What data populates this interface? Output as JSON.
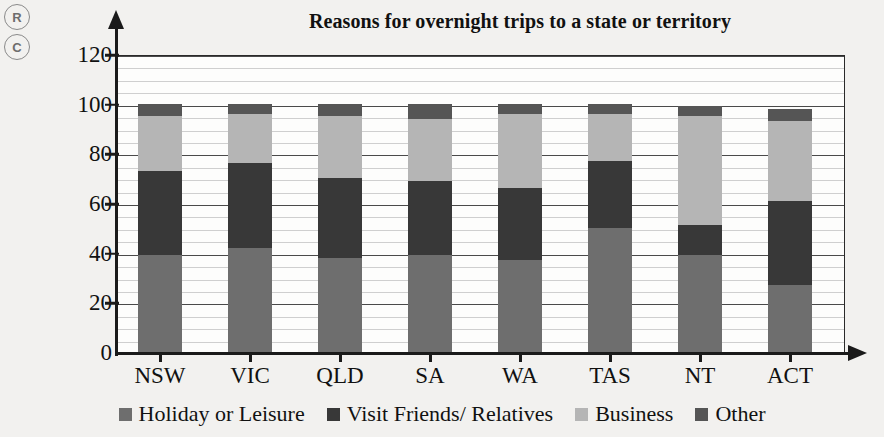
{
  "margin_marks": [
    {
      "name": "mark-r",
      "label": "R"
    },
    {
      "name": "mark-c",
      "label": "C"
    }
  ],
  "chart_data": {
    "type": "bar",
    "subtype": "stacked-bar",
    "title": "Reasons for overnight trips to a state or territory",
    "xlabel": "",
    "ylabel": "",
    "ylim": [
      0,
      120
    ],
    "y_major_ticks": [
      0,
      20,
      40,
      60,
      80,
      100,
      120
    ],
    "y_minor_step": 5,
    "grid": true,
    "legend_position": "bottom",
    "categories": [
      "NSW",
      "VIC",
      "QLD",
      "SA",
      "WA",
      "TAS",
      "NT",
      "ACT"
    ],
    "series": [
      {
        "name": "Holiday or Leisure",
        "color": "#6e6e6e",
        "values": [
          39,
          42,
          38,
          39,
          37,
          50,
          39,
          27
        ]
      },
      {
        "name": "Visit Friends/ Relatives",
        "color": "#383838",
        "values": [
          34,
          34,
          32,
          30,
          29,
          27,
          12,
          34
        ]
      },
      {
        "name": "Business",
        "color": "#b5b5b5",
        "values": [
          22,
          20,
          25,
          25,
          30,
          19,
          44,
          32
        ]
      },
      {
        "name": "Other",
        "color": "#555555",
        "values": [
          5,
          4,
          5,
          6,
          4,
          4,
          4,
          5
        ]
      }
    ],
    "cumulative_tops": {
      "NSW": [
        39,
        73,
        95,
        100
      ],
      "VIC": [
        42,
        76,
        96,
        100
      ],
      "QLD": [
        38,
        70,
        95,
        100
      ],
      "SA": [
        39,
        69,
        94,
        100
      ],
      "WA": [
        37,
        66,
        96,
        100
      ],
      "TAS": [
        50,
        77,
        96,
        100
      ],
      "NT": [
        39,
        51,
        95,
        99
      ],
      "ACT": [
        27,
        61,
        93,
        98
      ]
    }
  },
  "axis": {
    "y_tick_labels": [
      "0",
      "20",
      "40",
      "60",
      "80",
      "100",
      "120"
    ],
    "x_tick_labels": [
      "NSW",
      "VIC",
      "QLD",
      "SA",
      "WA",
      "TAS",
      "NT",
      "ACT"
    ]
  },
  "legend": {
    "items": [
      {
        "label": "Holiday or Leisure",
        "color": "#6e6e6e"
      },
      {
        "label": "Visit Friends/ Relatives",
        "color": "#383838"
      },
      {
        "label": "Business",
        "color": "#b5b5b5"
      },
      {
        "label": "Other",
        "color": "#555555"
      }
    ]
  }
}
